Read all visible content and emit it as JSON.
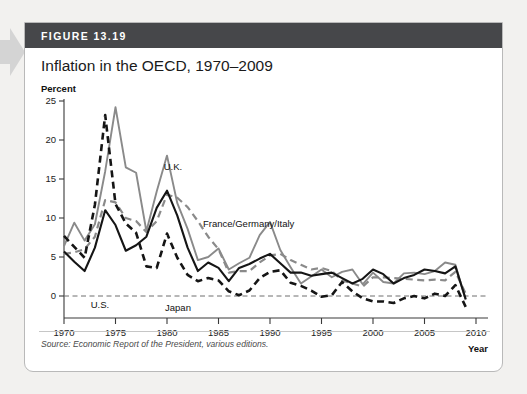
{
  "figure": {
    "number_label": "FIGURE 13.19",
    "title": "Inflation in the OECD, 1970–2009",
    "source_note": "Source: Economic Report of the President, various editions."
  },
  "chart_data": {
    "type": "line",
    "title": "Inflation in the OECD, 1970–2009",
    "xlabel": "Year",
    "ylabel": "Percent",
    "xlim": [
      1970,
      2010
    ],
    "ylim": [
      0,
      25
    ],
    "xticks": [
      1970,
      1975,
      1980,
      1985,
      1990,
      1995,
      2000,
      2005,
      2010
    ],
    "yticks": [
      0,
      5,
      10,
      15,
      20,
      25
    ],
    "grid": false,
    "zero_line": true,
    "legend_position": "inline-annotations",
    "x": [
      1970,
      1971,
      1972,
      1973,
      1974,
      1975,
      1976,
      1977,
      1978,
      1979,
      1980,
      1981,
      1982,
      1983,
      1984,
      1985,
      1986,
      1987,
      1988,
      1989,
      1990,
      1991,
      1992,
      1993,
      1994,
      1995,
      1996,
      1997,
      1998,
      1999,
      2000,
      2001,
      2002,
      2003,
      2004,
      2005,
      2006,
      2007,
      2008,
      2009
    ],
    "series": [
      {
        "name": "U.K.",
        "style": "solid",
        "color": "#8a8a8a",
        "label": "U.K.",
        "values": [
          6.4,
          9.4,
          7.1,
          9.2,
          16.0,
          24.2,
          16.5,
          15.8,
          8.3,
          13.4,
          18.0,
          11.9,
          8.6,
          4.6,
          5.0,
          6.1,
          3.4,
          4.2,
          4.9,
          7.8,
          9.5,
          5.9,
          3.7,
          1.6,
          2.5,
          3.4,
          2.4,
          3.1,
          3.4,
          1.5,
          3.0,
          1.8,
          1.6,
          2.9,
          3.0,
          2.8,
          3.2,
          4.3,
          4.0,
          -0.5
        ]
      },
      {
        "name": "France/Germany/Italy",
        "style": "dashed",
        "color": "#8a8a8a",
        "label": "France/Germany/Italy",
        "values": [
          5.4,
          5.6,
          6.0,
          7.6,
          12.3,
          12.0,
          10.0,
          9.6,
          8.2,
          9.6,
          13.0,
          12.6,
          11.4,
          9.6,
          7.6,
          6.0,
          3.0,
          3.2,
          3.2,
          4.3,
          5.2,
          5.4,
          4.6,
          4.0,
          3.4,
          3.6,
          3.2,
          2.0,
          1.6,
          1.2,
          2.4,
          2.4,
          2.3,
          2.2,
          2.1,
          2.0,
          2.1,
          2.0,
          3.1,
          0.3
        ]
      },
      {
        "name": "U.S.",
        "style": "solid",
        "color": "#151515",
        "label": "U.S.",
        "values": [
          5.7,
          4.4,
          3.2,
          6.2,
          11.0,
          9.1,
          5.8,
          6.5,
          7.6,
          11.3,
          13.5,
          10.3,
          6.2,
          3.2,
          4.3,
          3.6,
          1.9,
          3.6,
          4.1,
          4.8,
          5.4,
          4.2,
          3.0,
          3.0,
          2.6,
          2.8,
          3.0,
          2.3,
          1.6,
          2.2,
          3.4,
          2.8,
          1.6,
          2.3,
          2.7,
          3.4,
          3.2,
          2.9,
          3.8,
          -0.4
        ]
      },
      {
        "name": "Japan",
        "style": "dashed",
        "color": "#151515",
        "label": "Japan",
        "values": [
          7.7,
          6.3,
          4.9,
          11.7,
          23.2,
          11.8,
          9.3,
          8.1,
          3.8,
          3.6,
          8.0,
          4.9,
          2.7,
          1.9,
          2.3,
          2.0,
          0.6,
          0.1,
          0.7,
          2.3,
          3.1,
          3.3,
          1.7,
          1.3,
          0.7,
          -0.1,
          0.1,
          1.8,
          0.6,
          -0.3,
          -0.7,
          -0.7,
          -0.9,
          -0.3,
          0.0,
          -0.3,
          0.3,
          0.0,
          1.4,
          -1.4
        ]
      }
    ]
  }
}
